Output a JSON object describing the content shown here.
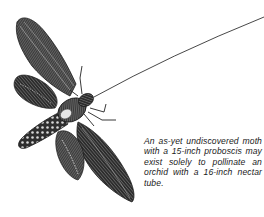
{
  "illustration": {
    "subject": "hawk moth with extended proboscis",
    "icon": "moth-icon",
    "colors": {
      "ink": "#1a1a1a",
      "mid": "#555555",
      "light": "#9a9a9a",
      "paper": "#ffffff"
    }
  },
  "caption": {
    "text": "An as-yet undiscovered moth with a 15-inch proboscis may exist solely to pollinate an orchid with a 16-inch nectar tube."
  }
}
